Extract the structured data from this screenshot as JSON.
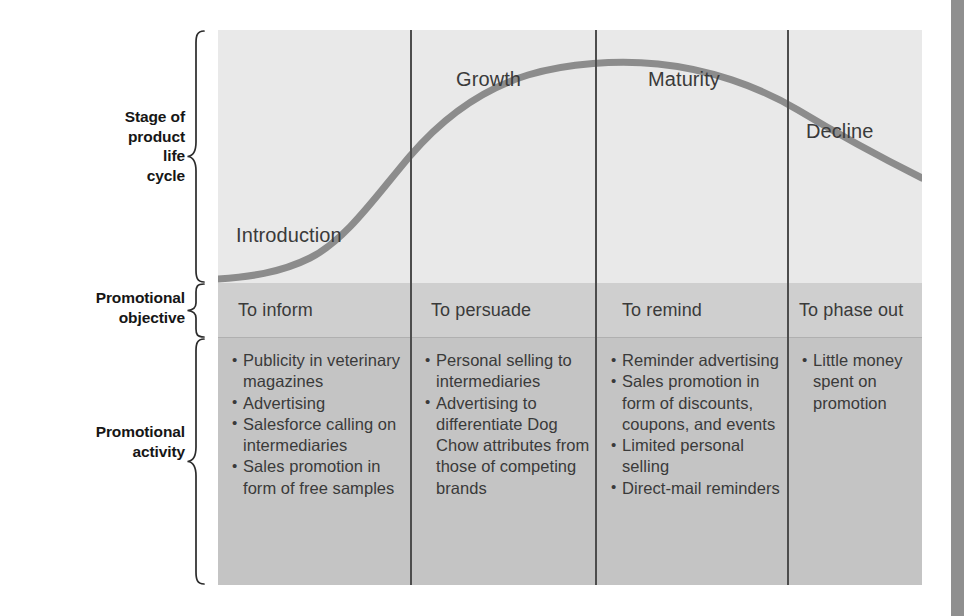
{
  "figure": {
    "row_labels": [
      {
        "id": "stage",
        "text": "Stage of\nproduct\nlife\ncycle"
      },
      {
        "id": "objective",
        "text": "Promotional\nobjective"
      },
      {
        "id": "activity",
        "text": "Promotional\nactivity"
      }
    ],
    "colors": {
      "band_lifecycle": "#e9e9e9",
      "band_objective": "#cfcfcf",
      "band_activity": "#c4c4c4",
      "curve": "#8c8c8c",
      "divider": "#4d4d4d",
      "text": "#3a3a3a",
      "label_text": "#161616",
      "page_edge": "#8f8f8f"
    }
  },
  "chart_data": {
    "type": "line",
    "title": "Stage of product life cycle",
    "xlabel": "",
    "ylabel": "Sales",
    "grid": false,
    "legend": "none",
    "x": [
      "Introduction",
      "Growth",
      "Maturity",
      "Decline"
    ],
    "series": [
      {
        "name": "Sales curve",
        "shape": "S-curve rising through Introduction and Growth, peaking in Maturity, falling in Decline",
        "points": [
          [
            0.0,
            0.02
          ],
          [
            0.1,
            0.04
          ],
          [
            0.18,
            0.09
          ],
          [
            0.27,
            0.24
          ],
          [
            0.36,
            0.47
          ],
          [
            0.45,
            0.68
          ],
          [
            0.55,
            0.84
          ],
          [
            0.65,
            0.93
          ],
          [
            0.73,
            0.96
          ],
          [
            0.81,
            0.93
          ],
          [
            0.9,
            0.82
          ],
          [
            1.0,
            0.66
          ]
        ]
      }
    ],
    "stage_boundaries": [
      0.273,
      0.536,
      0.809
    ],
    "stages": [
      {
        "name": "Introduction",
        "objective": "To inform",
        "activities": [
          "Publicity in veterinary magazines",
          "Advertising",
          "Salesforce calling on intermediaries",
          "Sales promotion in form of free samples"
        ]
      },
      {
        "name": "Growth",
        "objective": "To persuade",
        "activities": [
          "Personal selling to intermediaries",
          "Advertising to differentiate Dog Chow attributes from those of competing brands"
        ]
      },
      {
        "name": "Maturity",
        "objective": "To remind",
        "activities": [
          "Reminder advertising",
          "Sales promotion in form of discounts, coupons, and events",
          "Limited personal selling",
          "Direct-mail reminders"
        ]
      },
      {
        "name": "Decline",
        "objective": "To phase out",
        "activities": [
          "Little money spent on promotion"
        ]
      }
    ]
  }
}
